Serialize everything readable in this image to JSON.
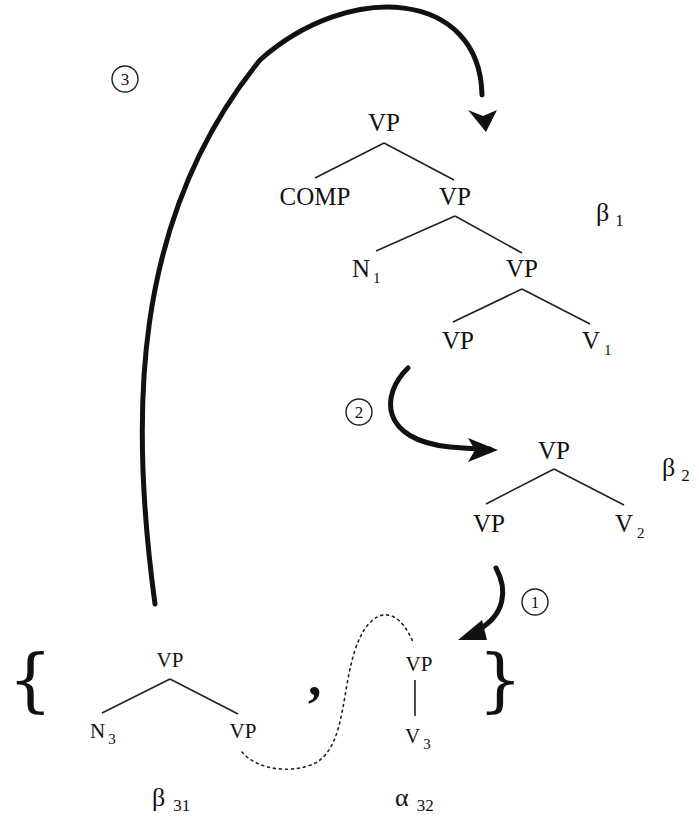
{
  "diagram": {
    "type": "tree-adjoining-grammar-derivation",
    "trees": {
      "beta_1": {
        "name": "β",
        "index": "1",
        "nodes": {
          "root": "VP",
          "comp": "COMP",
          "vp2": "VP",
          "n1": "N",
          "n1_sub": "1",
          "vp3": "VP",
          "vp4": "VP",
          "v1": "V",
          "v1_sub": "1"
        }
      },
      "beta_2": {
        "name": "β",
        "index": "2",
        "nodes": {
          "root": "VP",
          "vp": "VP",
          "v2": "V",
          "v2_sub": "2"
        }
      },
      "beta_31": {
        "name": "β",
        "index": "31",
        "nodes": {
          "root": "VP",
          "n3": "N",
          "n3_sub": "3",
          "vp": "VP"
        }
      },
      "alpha_32": {
        "name": "α",
        "index": "32",
        "nodes": {
          "root": "VP",
          "v3": "V",
          "v3_sub": "3"
        }
      }
    },
    "set_delimiters": {
      "open": "{",
      "close": "}",
      "separator": ","
    },
    "steps": [
      {
        "label": "①",
        "number": "1",
        "from": "beta_2",
        "to": "alpha_32"
      },
      {
        "label": "②",
        "number": "2",
        "from": "beta_1",
        "to": "beta_2"
      },
      {
        "label": "③",
        "number": "3",
        "from": "beta_31",
        "to": "beta_1"
      }
    ],
    "colors": {
      "ink": "#111111",
      "background": "#ffffff"
    }
  }
}
